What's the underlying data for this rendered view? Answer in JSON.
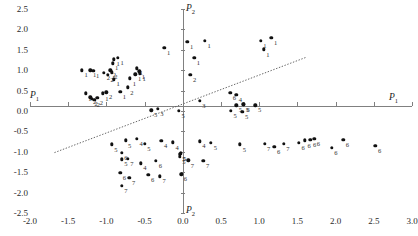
{
  "axes": {
    "x_name": "P",
    "x_sub": "1",
    "y_name": "P",
    "y_sub": "2",
    "x_name_left": "P",
    "x_sub_left": "1",
    "y_name_bottom": "P",
    "y_sub_bottom": "2"
  },
  "chart_data": {
    "type": "scatter",
    "title": "",
    "xlabel": "P1",
    "ylabel": "P2",
    "xlim": [
      -2.0,
      3.0
    ],
    "ylim": [
      -2.5,
      2.5
    ],
    "grid": false,
    "legend": "none",
    "xticks": [
      "-2.0",
      "-1.5",
      "-1.0",
      "-0.5",
      "0.0",
      "0.5",
      "1.0",
      "1.5",
      "2.0",
      "2.5",
      "3.0"
    ],
    "xtick_values": [
      -2.0,
      -1.5,
      -1.0,
      -0.5,
      0.0,
      0.5,
      1.0,
      1.5,
      2.0,
      2.5,
      3.0
    ],
    "yticks": [
      "2.5",
      "2.0",
      "1.5",
      "1.0",
      "0.5",
      "0.0",
      "-0.5",
      "-1.0",
      "-1.5",
      "-2.0",
      "-2.5"
    ],
    "ytick_values": [
      2.5,
      2.0,
      1.5,
      1.0,
      0.5,
      0.0,
      -0.5,
      -1.0,
      -1.5,
      -2.0,
      -2.5
    ],
    "annotations": [
      {
        "type": "trendline",
        "style": "dotted",
        "x1": -1.68,
        "y1": -1.02,
        "x2": 1.62,
        "y2": 1.32
      }
    ],
    "points": [
      {
        "x": -1.32,
        "y": 1.0,
        "label": "1"
      },
      {
        "x": -1.21,
        "y": 1.0,
        "label": "1"
      },
      {
        "x": -1.17,
        "y": 0.99,
        "label": "1"
      },
      {
        "x": -1.27,
        "y": 0.43,
        "label": "1"
      },
      {
        "x": -1.21,
        "y": 0.34,
        "label": "2"
      },
      {
        "x": -1.19,
        "y": 0.3,
        "label": "2"
      },
      {
        "x": -1.16,
        "y": 0.27,
        "label": "2"
      },
      {
        "x": -1.12,
        "y": 0.33,
        "label": "2"
      },
      {
        "x": -1.05,
        "y": 0.43,
        "label": "1"
      },
      {
        "x": -1.0,
        "y": 0.46,
        "label": "2"
      },
      {
        "x": -1.03,
        "y": 0.93,
        "label": "2"
      },
      {
        "x": -0.98,
        "y": 0.89,
        "label": "2"
      },
      {
        "x": -0.95,
        "y": 1.0,
        "label": "2"
      },
      {
        "x": -0.93,
        "y": 0.95,
        "label": "2"
      },
      {
        "x": -0.92,
        "y": 1.17,
        "label": "1"
      },
      {
        "x": -0.9,
        "y": 1.27,
        "label": "1"
      },
      {
        "x": -0.85,
        "y": 1.3,
        "label": "1"
      },
      {
        "x": -0.9,
        "y": 0.78,
        "label": "1"
      },
      {
        "x": -0.82,
        "y": 0.47,
        "label": "1"
      },
      {
        "x": -0.72,
        "y": 0.58,
        "label": "2"
      },
      {
        "x": -0.69,
        "y": 0.8,
        "label": "1"
      },
      {
        "x": -0.62,
        "y": 0.9,
        "label": "1"
      },
      {
        "x": -0.6,
        "y": 1.05,
        "label": "1"
      },
      {
        "x": -0.57,
        "y": 0.97,
        "label": "1"
      },
      {
        "x": -0.56,
        "y": 0.92,
        "label": "1"
      },
      {
        "x": -0.24,
        "y": 1.55,
        "label": "1"
      },
      {
        "x": 0.06,
        "y": 1.7,
        "label": "1"
      },
      {
        "x": 0.29,
        "y": 1.72,
        "label": "1"
      },
      {
        "x": 0.15,
        "y": 1.3,
        "label": "1"
      },
      {
        "x": 0.1,
        "y": 0.88,
        "label": "2"
      },
      {
        "x": 0.22,
        "y": 0.25,
        "label": "3"
      },
      {
        "x": 0.62,
        "y": 0.44,
        "label": "6"
      },
      {
        "x": 0.7,
        "y": 0.4,
        "label": "4"
      },
      {
        "x": 1.02,
        "y": 1.72,
        "label": "1"
      },
      {
        "x": 1.16,
        "y": 1.79,
        "label": "1"
      },
      {
        "x": 1.06,
        "y": 1.51,
        "label": "1"
      },
      {
        "x": -0.05,
        "y": 0.0,
        "label": "5"
      },
      {
        "x": -0.41,
        "y": 0.02,
        "label": "5"
      },
      {
        "x": -0.33,
        "y": 0.05,
        "label": "3"
      },
      {
        "x": 0.7,
        "y": 0.14,
        "label": "5"
      },
      {
        "x": 0.8,
        "y": 0.16,
        "label": "6"
      },
      {
        "x": 0.79,
        "y": 0.16,
        "label": "5"
      },
      {
        "x": 0.95,
        "y": 0.14,
        "label": "5"
      },
      {
        "x": 0.63,
        "y": 0.0,
        "label": "5"
      },
      {
        "x": 0.78,
        "y": -0.02,
        "label": "5"
      },
      {
        "x": -0.93,
        "y": -0.82,
        "label": "5"
      },
      {
        "x": -0.75,
        "y": -0.72,
        "label": "5"
      },
      {
        "x": -0.6,
        "y": -0.68,
        "label": "4"
      },
      {
        "x": -0.5,
        "y": -0.8,
        "label": "5"
      },
      {
        "x": -0.28,
        "y": -0.73,
        "label": "4"
      },
      {
        "x": -0.13,
        "y": -0.77,
        "label": "4"
      },
      {
        "x": -0.8,
        "y": -1.02,
        "label": "6"
      },
      {
        "x": -0.8,
        "y": -1.18,
        "label": "5"
      },
      {
        "x": -0.72,
        "y": -1.17,
        "label": "7"
      },
      {
        "x": -0.55,
        "y": -1.28,
        "label": "4"
      },
      {
        "x": -0.35,
        "y": -1.22,
        "label": "6"
      },
      {
        "x": -0.82,
        "y": -1.52,
        "label": "6"
      },
      {
        "x": -0.7,
        "y": -1.63,
        "label": "7"
      },
      {
        "x": -0.8,
        "y": -1.83,
        "label": "7"
      },
      {
        "x": -0.45,
        "y": -1.56,
        "label": "6"
      },
      {
        "x": -0.3,
        "y": -1.6,
        "label": "7"
      },
      {
        "x": -0.04,
        "y": -1.06,
        "label": "5"
      },
      {
        "x": -0.03,
        "y": -1.04,
        "label": "5"
      },
      {
        "x": -0.04,
        "y": -1.12,
        "label": "5"
      },
      {
        "x": 0.07,
        "y": -1.21,
        "label": "7"
      },
      {
        "x": -0.02,
        "y": -1.55,
        "label": "6"
      },
      {
        "x": 0.22,
        "y": -0.74,
        "label": "4"
      },
      {
        "x": 0.37,
        "y": -0.78,
        "label": "5"
      },
      {
        "x": 0.27,
        "y": -1.22,
        "label": "7"
      },
      {
        "x": 0.75,
        "y": -0.82,
        "label": "5"
      },
      {
        "x": 1.07,
        "y": -0.8,
        "label": "7"
      },
      {
        "x": 1.2,
        "y": -0.88,
        "label": "6"
      },
      {
        "x": 1.32,
        "y": -0.8,
        "label": "7"
      },
      {
        "x": 1.52,
        "y": -0.78,
        "label": "6"
      },
      {
        "x": 1.6,
        "y": -0.72,
        "label": "6"
      },
      {
        "x": 1.67,
        "y": -0.7,
        "label": "6"
      },
      {
        "x": 1.72,
        "y": -0.68,
        "label": "6"
      },
      {
        "x": 1.95,
        "y": -0.9,
        "label": "6"
      },
      {
        "x": 2.1,
        "y": -0.7,
        "label": "6"
      },
      {
        "x": 2.52,
        "y": -0.86,
        "label": "6"
      }
    ]
  }
}
